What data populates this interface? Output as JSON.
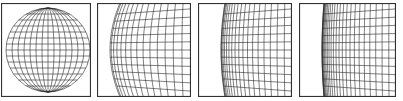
{
  "figure": {
    "panels": [
      {
        "id": "sphere",
        "label": "",
        "x": 1,
        "width": 90,
        "grid_lines": 14
      },
      {
        "id": "limb-zoom-1",
        "label": "",
        "x": 97,
        "width": 94,
        "grid_lines": 14
      },
      {
        "id": "limb-zoom-2",
        "label": "",
        "x": 198,
        "width": 94,
        "grid_lines": 18
      },
      {
        "id": "limb-zoom-3",
        "label": "",
        "x": 299,
        "width": 97,
        "grid_lines": 24
      }
    ],
    "colors": {
      "stroke": "#2a2a2a",
      "frame": "#333333",
      "background": "#ffffff"
    }
  }
}
